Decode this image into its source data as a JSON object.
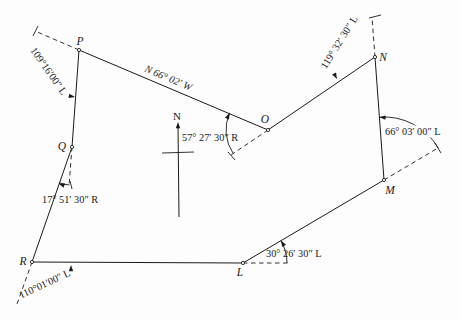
{
  "figure": {
    "type": "survey-traverse-diagram",
    "canvas": {
      "width": 460,
      "height": 320
    },
    "colors": {
      "background": "#fdfdfd",
      "ink": "#1a1a1a"
    },
    "stations": [
      {
        "name": "P",
        "x": 79,
        "y": 50,
        "label_x": 80,
        "label_y": 45
      },
      {
        "name": "Q",
        "x": 72,
        "y": 147,
        "label_x": 62,
        "label_y": 150
      },
      {
        "name": "R",
        "x": 32,
        "y": 262,
        "label_x": 23,
        "label_y": 265
      },
      {
        "name": "L",
        "x": 243,
        "y": 263,
        "label_x": 240,
        "label_y": 276
      },
      {
        "name": "M",
        "x": 384,
        "y": 180,
        "label_x": 390,
        "label_y": 194
      },
      {
        "name": "N",
        "x": 375,
        "y": 57,
        "label_x": 383,
        "label_y": 61
      },
      {
        "name": "O",
        "x": 268,
        "y": 130,
        "label_x": 265,
        "label_y": 123
      }
    ],
    "courses": [
      [
        "P",
        "O"
      ],
      [
        "O",
        "N"
      ],
      [
        "N",
        "M"
      ],
      [
        "M",
        "L"
      ],
      [
        "L",
        "R"
      ],
      [
        "R",
        "Q"
      ],
      [
        "Q",
        "P"
      ]
    ],
    "extensions": [
      {
        "at": "P",
        "x2": 35,
        "y2": 31
      },
      {
        "at": "Q",
        "x2": 69,
        "y2": 186
      },
      {
        "at": "R",
        "x2": 17,
        "y2": 304
      },
      {
        "at": "L",
        "x2": 290,
        "y2": 263
      },
      {
        "at": "M",
        "x2": 438,
        "y2": 148
      },
      {
        "at": "N",
        "x2": 372,
        "y2": 17
      },
      {
        "at": "O",
        "x2": 231,
        "y2": 155
      }
    ],
    "ticks": [
      {
        "name": "tick-P-extension",
        "x1": 33,
        "y1": 36,
        "x2": 38,
        "y2": 26
      },
      {
        "name": "tick-N-extension",
        "x1": 369,
        "y1": 18,
        "x2": 381,
        "y2": 15
      },
      {
        "name": "tick-M-extension",
        "x1": 435,
        "y1": 143,
        "x2": 441,
        "y2": 153
      },
      {
        "name": "tick-O-extension",
        "x1": 228,
        "y1": 152,
        "x2": 235,
        "y2": 160
      },
      {
        "name": "tick-Q-extension",
        "x1": 70,
        "y1": 181,
        "x2": 72,
        "y2": 189
      }
    ],
    "arcs": [
      {
        "name": "angle-arc-O",
        "cx": 268,
        "cy": 130,
        "r": 42,
        "from": 146,
        "to": 204
      },
      {
        "name": "angle-arc-Q",
        "cx": 72,
        "cy": 147,
        "r": 38,
        "from": 94,
        "to": 110
      },
      {
        "name": "angle-arc-L",
        "cx": 243,
        "cy": 263,
        "r": 44,
        "from": 0,
        "to": -30.5
      },
      {
        "name": "angle-arc-M",
        "cx": 384,
        "cy": 180,
        "r": 63,
        "from": -30.6,
        "to": -94.2
      }
    ],
    "arrows": [
      {
        "name": "arrow-arc-O",
        "x": 229.5,
        "y": 113,
        "angle": -66
      },
      {
        "name": "arrow-arc-Q",
        "x": 58.5,
        "y": 183.5,
        "angle": 200
      },
      {
        "name": "arrow-arc-L",
        "x": 281,
        "y": 240.5,
        "angle": -120
      },
      {
        "name": "arrow-arc-M",
        "x": 379.4,
        "y": 117.2,
        "angle": 184
      },
      {
        "name": "arrow-angle-P",
        "x": 75,
        "y": 97,
        "angle": 10
      },
      {
        "name": "arrow-angle-N",
        "x": 337,
        "y": 79,
        "angle": 62
      },
      {
        "name": "arrow-angle-R",
        "x": 71,
        "y": 265,
        "angle": -90
      },
      {
        "name": "arrow-north",
        "x": 178,
        "y": 122,
        "angle": -90
      }
    ],
    "north_arrow": {
      "label": "N",
      "label_x": 177,
      "label_y": 120,
      "x1": 178,
      "y1": 126,
      "x2": 179,
      "y2": 217,
      "cross_x1": 162,
      "cross_y1": 153,
      "cross_x2": 194,
      "cross_y2": 152
    },
    "angle_labels": [
      {
        "name": "angle-label-P",
        "text": "109°16′00″ L",
        "x": 46,
        "y": 73,
        "rotate": 55,
        "anchor": "middle",
        "italic": false,
        "bg": false
      },
      {
        "name": "bearing-label-PO",
        "text": "N 66° 02′ W",
        "x": 167,
        "y": 81,
        "rotate": 23,
        "anchor": "middle",
        "italic": true,
        "bg": false
      },
      {
        "name": "angle-label-N",
        "text": "119° 32′ 30″ L",
        "x": 342,
        "y": 44,
        "rotate": -58,
        "anchor": "middle",
        "italic": false,
        "bg": false
      },
      {
        "name": "angle-label-O",
        "text": "57° 27′ 30″ R",
        "x": 182,
        "y": 141,
        "rotate": 0,
        "anchor": "start",
        "italic": false,
        "bg": false
      },
      {
        "name": "angle-label-M",
        "text": "66° 03′ 00″ L",
        "x": 385,
        "y": 135,
        "rotate": 0,
        "anchor": "start",
        "italic": false,
        "bg": true
      },
      {
        "name": "angle-label-Q",
        "text": "17° 51′ 30″ R",
        "x": 42,
        "y": 203,
        "rotate": 0,
        "anchor": "start",
        "italic": false,
        "bg": false
      },
      {
        "name": "angle-label-L",
        "text": "30° 26′ 30″ L",
        "x": 266,
        "y": 257,
        "rotate": 0,
        "anchor": "start",
        "italic": false,
        "bg": false
      },
      {
        "name": "angle-label-R",
        "text": "110°01′00″ L",
        "x": 46,
        "y": 287,
        "rotate": -25,
        "anchor": "middle",
        "italic": false,
        "bg": false
      }
    ]
  }
}
